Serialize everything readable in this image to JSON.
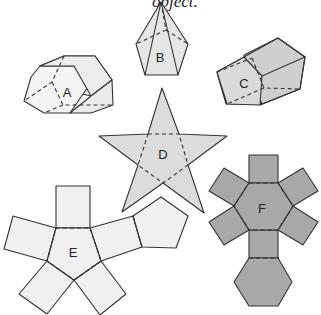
{
  "caption": "object.",
  "colors": {
    "light_fill": "#f0f0f0",
    "mid_fill": "#d9d9d9",
    "star_fill": "#dcdcdc",
    "dark_fill": "#a8a8a8",
    "stroke": "#333333"
  },
  "figures": [
    {
      "id": "A",
      "label": "A",
      "kind": "hexagonal prism (3D)"
    },
    {
      "id": "B",
      "label": "B",
      "kind": "pentagonal pyramid (3D)"
    },
    {
      "id": "C",
      "label": "C",
      "kind": "pentagonal prism (3D)"
    },
    {
      "id": "D",
      "label": "D",
      "kind": "net: pentagon with 5 triangles (star)"
    },
    {
      "id": "E",
      "label": "E",
      "kind": "net: pentagon with 5 rectangles and 1 pentagon"
    },
    {
      "id": "F",
      "label": "F",
      "kind": "net: hexagon with 6 rectangles and 1 hexagon"
    }
  ]
}
